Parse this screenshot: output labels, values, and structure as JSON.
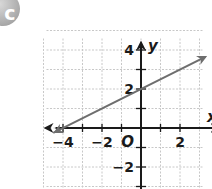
{
  "badge": {
    "label": "c",
    "color": "#a9a9a9"
  },
  "chart_data": {
    "type": "line",
    "title": "",
    "xlabel": "x",
    "ylabel": "y",
    "origin_label": "O",
    "xlim": [
      -5,
      3
    ],
    "ylim": [
      -3,
      5
    ],
    "grid": true,
    "x_tick_labels": [
      "-4",
      "-2",
      "2"
    ],
    "y_tick_labels": [
      "4",
      "2",
      "-2"
    ],
    "x_ticks": [
      -4,
      -3,
      -2,
      -1,
      1,
      2
    ],
    "y_ticks": [
      4,
      3,
      2,
      1,
      -1,
      -2,
      -3
    ],
    "series": [
      {
        "name": "line",
        "equation": "y = 0.5x + 2",
        "points": [
          [
            -4,
            0
          ],
          [
            0,
            2
          ]
        ],
        "x": [
          -4.5,
          3.3
        ],
        "y": [
          -0.25,
          3.65
        ],
        "arrows": "both",
        "color": "#6e6e6e"
      }
    ]
  },
  "colors": {
    "grid": "#c8c8c8",
    "axis": "#1a1a1a",
    "line": "#6e6e6e"
  }
}
